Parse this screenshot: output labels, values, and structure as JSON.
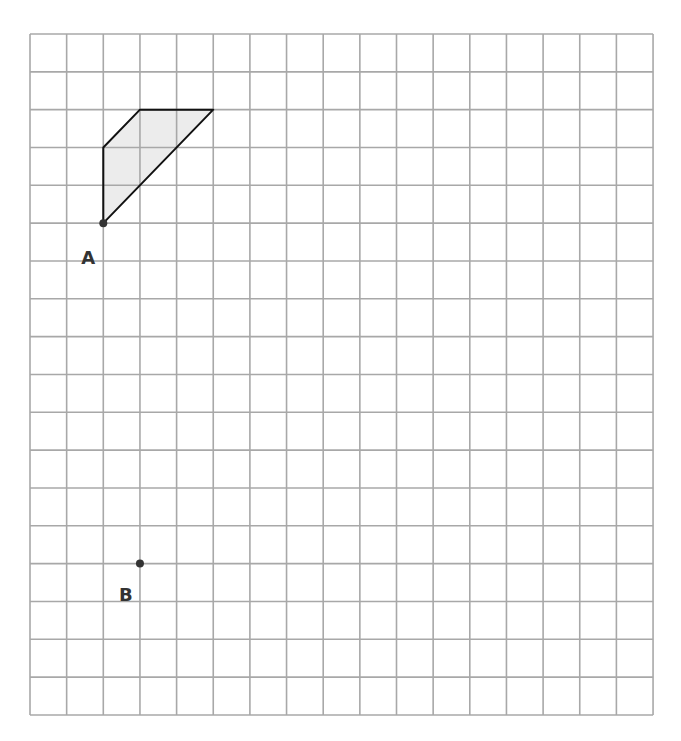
{
  "grid": {
    "columns": 17,
    "rows": 18,
    "left": 30,
    "top": 34,
    "cell_width": 36.65,
    "cell_height": 37.83,
    "line_color": "#a8a8a8"
  },
  "shape": {
    "vertices": [
      [
        2,
        5
      ],
      [
        2,
        3
      ],
      [
        3,
        2
      ],
      [
        5,
        2
      ]
    ],
    "fill": "#ececec",
    "stroke": "#111111"
  },
  "points": [
    {
      "label": "A",
      "col": 2,
      "row": 5,
      "label_dx": -22,
      "label_dy": 24
    },
    {
      "label": "B",
      "col": 3,
      "row": 14,
      "label_dx": -21,
      "label_dy": 20
    }
  ]
}
